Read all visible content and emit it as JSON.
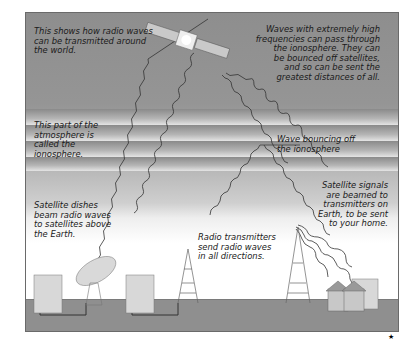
{
  "diagram": {
    "labels": {
      "intro": "This shows how radio waves\ncan be transmitted around\nthe world.",
      "high_freq": "Waves with extremely high\nfrequencies can pass through\nthe ionosphere. They can\nbe bounced off satellites,\nand so can be sent the\ngreatest distances of all.",
      "ionosphere": "This part of the\natmosphere is\ncalled the\nionosphere.",
      "bounce": "Wave bouncing off\nthe ionosphere",
      "dishes": "Satellite dishes\nbeam radio waves\nto satellites above\nthe Earth.",
      "transmitters": "Radio transmitters\nsend radio waves\nin all directions.",
      "satellite_signals": "Satellite signals\nare beamed to\ntransmitters on\nEarth, to be sent\nto your home."
    },
    "icons": [
      "satellite-icon",
      "satellite-dish-icon",
      "radio-tower-icon",
      "building-icon",
      "house-icon"
    ],
    "colors": {
      "sky_top": "#8e8e8e",
      "ground": "#8f8f8f",
      "wave": "#333333"
    },
    "footer_mark": "★"
  }
}
